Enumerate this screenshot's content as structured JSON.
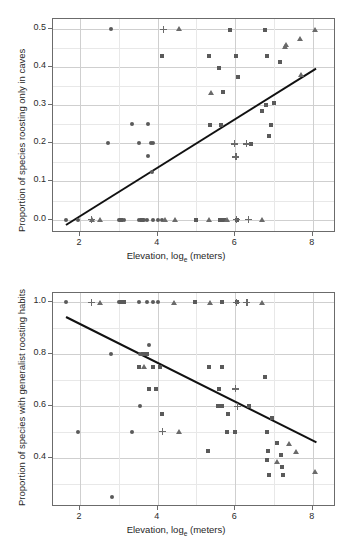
{
  "figure": {
    "marker_color": "#5a5a5a",
    "line_color": "#111111",
    "grid_color": "#cfcfcf"
  },
  "chart_data": [
    {
      "type": "scatter",
      "panel": "top",
      "title": "",
      "xlabel_prefix": "Elevation, log",
      "xlabel_sub": "e",
      "xlabel_suffix": " (meters)",
      "ylabel": "Proportion of species roosting only in caves",
      "xlim": [
        1.3,
        8.6
      ],
      "ylim": [
        -0.035,
        0.525
      ],
      "xticks": [
        2,
        4,
        6,
        8
      ],
      "xticklabels": [
        "2",
        "4",
        "6",
        "8"
      ],
      "yticks": [
        0.0,
        0.1,
        0.2,
        0.3,
        0.4,
        0.5
      ],
      "yticklabels": [
        "0.0",
        "0.1",
        "0.2",
        "0.3",
        "0.4",
        "0.5"
      ],
      "y_minor_ticks": [
        0.05,
        0.15,
        0.25,
        0.35,
        0.45
      ],
      "x_minor_ticks": [
        3,
        5,
        7
      ],
      "grid": true,
      "legend": "none",
      "fit_line": {
        "x0": 1.64,
        "y0": -0.012,
        "x1": 8.1,
        "y1": 0.398
      },
      "series": [
        {
          "name": "circle",
          "marker": "circle",
          "points": [
            [
              2.79,
              0.5
            ],
            [
              2.72,
              0.2
            ],
            [
              3.33,
              0.25
            ],
            [
              3.53,
              0.2
            ],
            [
              3.75,
              0.25
            ],
            [
              3.82,
              0.2
            ],
            [
              3.88,
              0.2
            ],
            [
              3.76,
              0.166
            ],
            [
              3.86,
              0.125
            ],
            [
              1.63,
              0.0
            ],
            [
              1.95,
              0.0
            ],
            [
              3.0,
              0.0
            ],
            [
              3.12,
              0.0
            ],
            [
              3.52,
              0.0
            ],
            [
              3.58,
              0.0
            ],
            [
              3.66,
              0.0
            ],
            [
              3.73,
              0.0
            ],
            [
              3.87,
              0.0
            ],
            [
              4.0,
              0.0
            ],
            [
              4.1,
              0.0
            ]
          ]
        },
        {
          "name": "square",
          "marker": "square",
          "points": [
            [
              4.1,
              0.427
            ],
            [
              5.32,
              0.427
            ],
            [
              5.58,
              0.397
            ],
            [
              5.68,
              0.333
            ],
            [
              5.86,
              0.497
            ],
            [
              6.03,
              0.427
            ],
            [
              6.06,
              0.373
            ],
            [
              6.78,
              0.497
            ],
            [
              6.82,
              0.427
            ],
            [
              7.16,
              0.412
            ],
            [
              6.79,
              0.299
            ],
            [
              6.68,
              0.283
            ],
            [
              7.0,
              0.305
            ],
            [
              6.93,
              0.247
            ],
            [
              6.88,
              0.22
            ],
            [
              5.34,
              0.247
            ],
            [
              5.64,
              0.247
            ],
            [
              6.42,
              0.198
            ],
            [
              5.0,
              0.0
            ],
            [
              5.6,
              0.0
            ],
            [
              5.72,
              0.0
            ],
            [
              6.04,
              0.0
            ],
            [
              3.05,
              0.0
            ],
            [
              3.6,
              0.0
            ]
          ]
        },
        {
          "name": "triangle",
          "marker": "triangle",
          "points": [
            [
              4.55,
              0.5
            ],
            [
              8.05,
              0.497
            ],
            [
              7.66,
              0.473
            ],
            [
              7.32,
              0.457
            ],
            [
              7.28,
              0.452
            ],
            [
              7.7,
              0.381
            ],
            [
              5.37,
              0.333
            ],
            [
              2.52,
              0.0
            ],
            [
              4.2,
              0.0
            ],
            [
              4.45,
              0.0
            ],
            [
              5.32,
              0.0
            ],
            [
              5.8,
              0.0
            ],
            [
              6.68,
              0.0
            ],
            [
              2.3,
              0.0
            ]
          ]
        },
        {
          "name": "plus",
          "marker": "plus",
          "points": [
            [
              4.15,
              0.497
            ],
            [
              5.97,
              0.198
            ],
            [
              6.28,
              0.198
            ],
            [
              6.02,
              0.164
            ],
            [
              2.3,
              0.0
            ],
            [
              6.04,
              0.0
            ],
            [
              6.34,
              0.0
            ]
          ]
        }
      ]
    },
    {
      "type": "scatter",
      "panel": "bottom",
      "title": "",
      "xlabel_prefix": "Elevation, log",
      "xlabel_sub": "e",
      "xlabel_suffix": " (meters)",
      "ylabel": "Proportion of species with generalist roosting habits",
      "xlim": [
        1.3,
        8.6
      ],
      "ylim": [
        0.21,
        1.035
      ],
      "xticks": [
        2,
        4,
        6,
        8
      ],
      "xticklabels": [
        "2",
        "4",
        "6",
        "8"
      ],
      "yticks": [
        0.4,
        0.6,
        0.8,
        1.0
      ],
      "yticklabels": [
        "0.4",
        "0.6",
        "0.8",
        "1.0"
      ],
      "y_minor_ticks": [
        0.3,
        0.5,
        0.7,
        0.9
      ],
      "x_minor_ticks": [
        3,
        5,
        7
      ],
      "grid": true,
      "legend": "none",
      "fit_line": {
        "x0": 1.64,
        "y0": 0.945,
        "x1": 8.1,
        "y1": 0.462
      },
      "series": [
        {
          "name": "circle",
          "marker": "circle",
          "points": [
            [
              1.63,
              1.0
            ],
            [
              2.8,
              0.8
            ],
            [
              3.55,
              0.8
            ],
            [
              3.78,
              0.833
            ],
            [
              3.55,
              0.6
            ],
            [
              1.95,
              0.5
            ],
            [
              3.33,
              0.5
            ],
            [
              2.82,
              0.25
            ],
            [
              3.0,
              1.0
            ],
            [
              3.1,
              1.0
            ],
            [
              3.52,
              1.0
            ],
            [
              3.72,
              1.0
            ],
            [
              3.88,
              1.0
            ],
            [
              4.0,
              1.0
            ]
          ]
        },
        {
          "name": "square",
          "marker": "square",
          "points": [
            [
              3.62,
              0.8
            ],
            [
              3.72,
              0.8
            ],
            [
              3.52,
              0.75
            ],
            [
              3.88,
              0.75
            ],
            [
              4.05,
              0.75
            ],
            [
              3.78,
              0.665
            ],
            [
              3.95,
              0.665
            ],
            [
              4.1,
              0.57
            ],
            [
              5.33,
              0.75
            ],
            [
              5.66,
              0.75
            ],
            [
              5.58,
              0.665
            ],
            [
              5.56,
              0.6
            ],
            [
              5.66,
              0.6
            ],
            [
              5.82,
              0.57
            ],
            [
              6.35,
              0.6
            ],
            [
              6.78,
              0.71
            ],
            [
              5.3,
              0.425
            ],
            [
              5.78,
              0.5
            ],
            [
              6.0,
              0.5
            ],
            [
              6.82,
              0.5
            ],
            [
              6.85,
              0.425
            ],
            [
              6.82,
              0.39
            ],
            [
              6.86,
              0.332
            ],
            [
              7.08,
              0.455
            ],
            [
              7.18,
              0.41
            ],
            [
              7.2,
              0.365
            ],
            [
              7.22,
              0.332
            ],
            [
              6.95,
              0.553
            ],
            [
              3.05,
              1.0
            ],
            [
              3.12,
              1.0
            ],
            [
              4.95,
              1.0
            ],
            [
              5.65,
              1.0
            ],
            [
              6.05,
              1.0
            ]
          ]
        },
        {
          "name": "triangle",
          "marker": "triangle",
          "points": [
            [
              2.52,
              1.0
            ],
            [
              4.42,
              1.0
            ],
            [
              5.35,
              1.0
            ],
            [
              6.68,
              1.0
            ],
            [
              3.66,
              0.75
            ],
            [
              4.55,
              0.5
            ],
            [
              7.08,
              0.385
            ],
            [
              7.38,
              0.455
            ],
            [
              7.58,
              0.425
            ],
            [
              8.05,
              0.345
            ]
          ]
        },
        {
          "name": "plus",
          "marker": "plus",
          "points": [
            [
              2.3,
              1.0
            ],
            [
              6.03,
              1.0
            ],
            [
              6.3,
              1.0
            ],
            [
              6.0,
              0.665
            ],
            [
              6.05,
              0.597
            ],
            [
              4.12,
              0.5
            ]
          ]
        }
      ]
    }
  ]
}
